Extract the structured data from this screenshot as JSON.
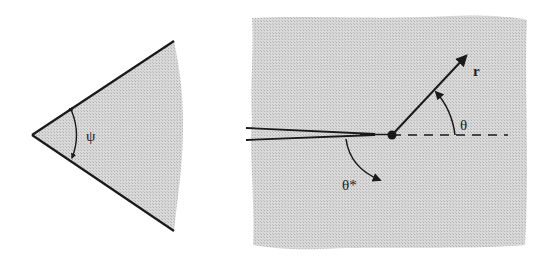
{
  "figure": {
    "left_panel": {
      "description": "Wedge with opening angle",
      "angle_label": "ψ"
    },
    "right_panel": {
      "description": "Crack tip with polar coordinates",
      "radius_label": "r",
      "angle_label": "θ",
      "crack_angle_label": "θ*"
    },
    "colors": {
      "fill": "#d4d4d4",
      "line": "#1a1a1a",
      "background": "#ffffff"
    }
  }
}
